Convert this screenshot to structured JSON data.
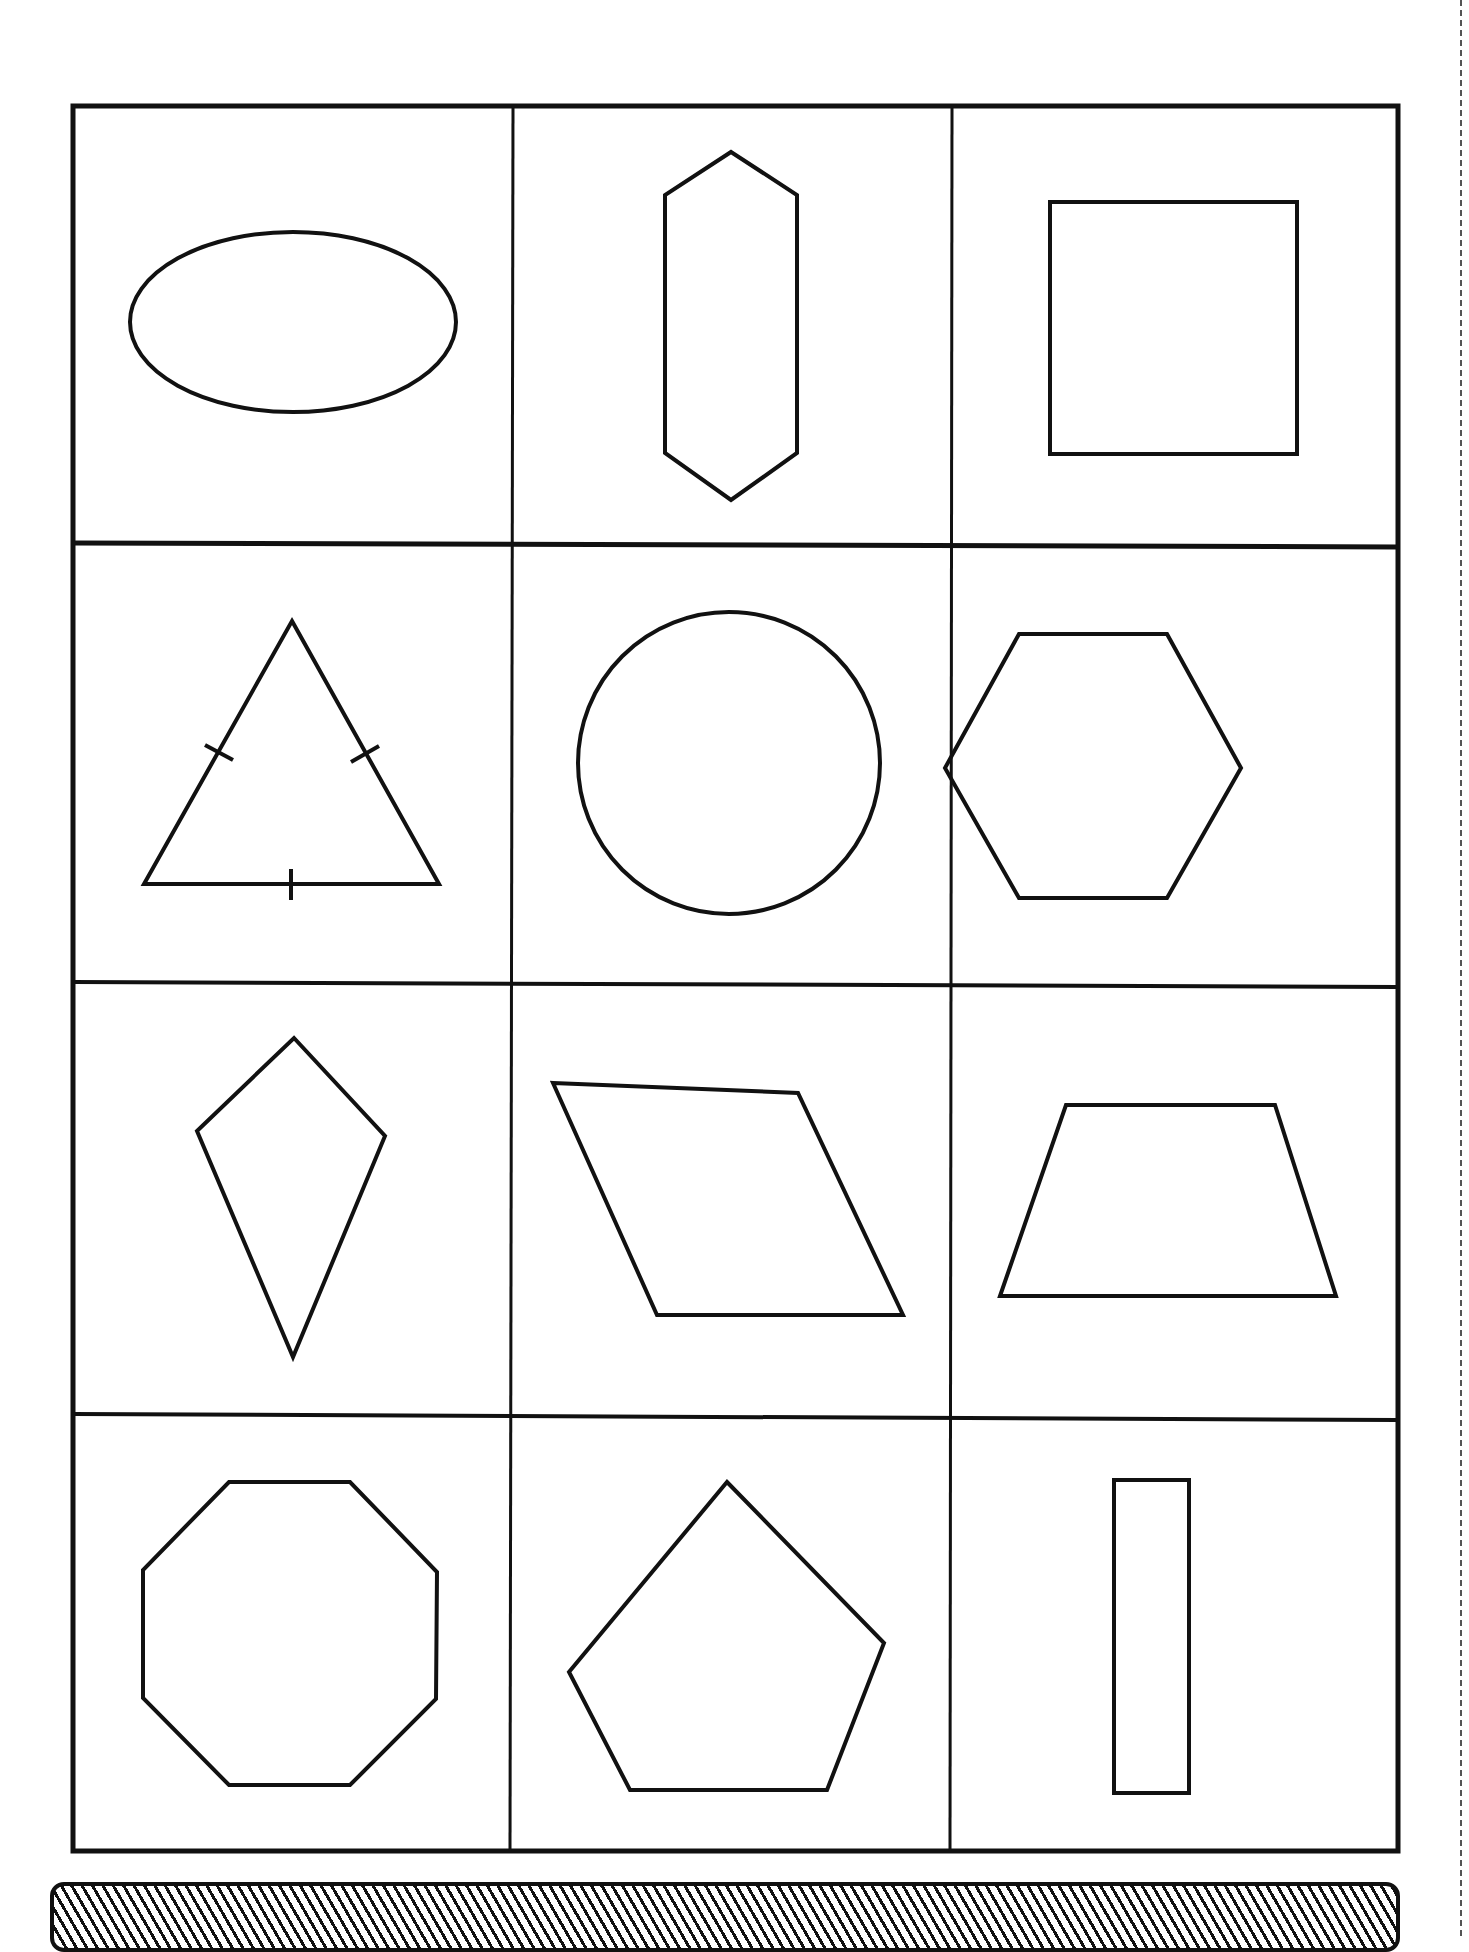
{
  "worksheet": {
    "grid": {
      "rows": 4,
      "cols": 3
    },
    "cells": [
      {
        "row": 0,
        "col": 0,
        "shape": "ellipse"
      },
      {
        "row": 0,
        "col": 1,
        "shape": "elongated-hexagon"
      },
      {
        "row": 0,
        "col": 2,
        "shape": "square"
      },
      {
        "row": 1,
        "col": 0,
        "shape": "equilateral-triangle",
        "tick_marks": 3
      },
      {
        "row": 1,
        "col": 1,
        "shape": "circle"
      },
      {
        "row": 1,
        "col": 2,
        "shape": "regular-hexagon"
      },
      {
        "row": 2,
        "col": 0,
        "shape": "kite"
      },
      {
        "row": 2,
        "col": 1,
        "shape": "parallelogram"
      },
      {
        "row": 2,
        "col": 2,
        "shape": "trapezoid"
      },
      {
        "row": 3,
        "col": 0,
        "shape": "octagon"
      },
      {
        "row": 3,
        "col": 1,
        "shape": "pentagon"
      },
      {
        "row": 3,
        "col": 2,
        "shape": "rectangle"
      }
    ],
    "colors": {
      "ink": "#111111",
      "paper": "#ffffff"
    }
  }
}
